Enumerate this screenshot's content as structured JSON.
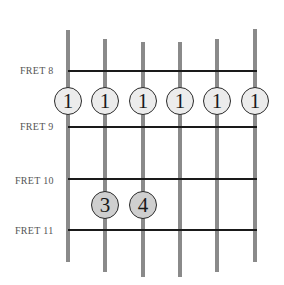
{
  "diagram": {
    "type": "guitar-fretboard-chord",
    "frets": [
      {
        "label": "FRET 8",
        "y": 71
      },
      {
        "label": "FRET 9",
        "y": 127
      },
      {
        "label": "FRET 10",
        "y": 179
      },
      {
        "label": "FRET 11",
        "y": 230
      }
    ],
    "strings": [
      {
        "x": 66,
        "top": 30,
        "bottom": 262
      },
      {
        "x": 103,
        "top": 39,
        "bottom": 272
      },
      {
        "x": 141,
        "top": 42,
        "bottom": 277
      },
      {
        "x": 178,
        "top": 42,
        "bottom": 277
      },
      {
        "x": 215,
        "top": 39,
        "bottom": 272
      },
      {
        "x": 253,
        "top": 29,
        "bottom": 262
      }
    ],
    "fingers": [
      {
        "string": 1,
        "fret": 8,
        "finger": "1",
        "style": "open"
      },
      {
        "string": 2,
        "fret": 8,
        "finger": "1",
        "style": "open"
      },
      {
        "string": 3,
        "fret": 8,
        "finger": "1",
        "style": "open"
      },
      {
        "string": 4,
        "fret": 8,
        "finger": "1",
        "style": "open"
      },
      {
        "string": 5,
        "fret": 8,
        "finger": "1",
        "style": "open"
      },
      {
        "string": 6,
        "fret": 8,
        "finger": "1",
        "style": "open"
      },
      {
        "string": 2,
        "fret": 10,
        "finger": "3",
        "style": "shaded"
      },
      {
        "string": 3,
        "fret": 10,
        "finger": "4",
        "style": "shaded"
      }
    ],
    "colors": {
      "string": "#8a8a8a",
      "fret": "#1a1a1a",
      "open_dot": "#ececec",
      "shaded_dot": "#cfcfcf"
    }
  }
}
